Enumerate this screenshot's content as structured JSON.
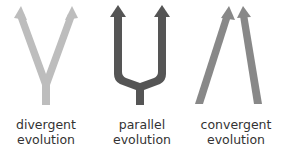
{
  "figure": {
    "panels": [
      {
        "id": "divergent",
        "line1": "divergent",
        "line2": "evolution",
        "color": "#bdbdbd",
        "shape": "Y-shaped branching arrows"
      },
      {
        "id": "parallel",
        "line1": "parallel",
        "line2": "evolution",
        "color": "#555555",
        "shape": "fork with two parallel upward arrows"
      },
      {
        "id": "convergent",
        "line1": "convergent",
        "line2": "evolution",
        "color": "#888888",
        "shape": "two arrows converging upward"
      }
    ]
  }
}
